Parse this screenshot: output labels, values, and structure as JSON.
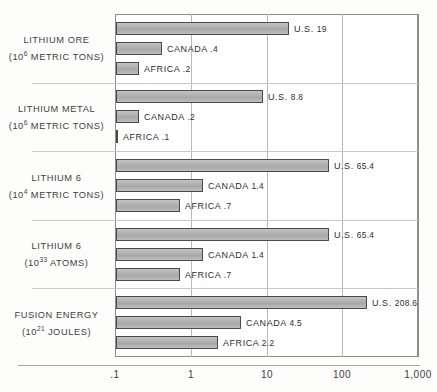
{
  "chart_data": {
    "type": "bar",
    "orientation": "horizontal",
    "title": "",
    "xlabel": "",
    "ylabel": "",
    "xscale": "log",
    "xlim": [
      0.1,
      1000
    ],
    "grid": true,
    "legend_position": "none",
    "xticks": [
      ".1",
      "1",
      "10",
      "100",
      "1,000"
    ],
    "xtick_values": [
      0.1,
      1,
      10,
      100,
      1000
    ],
    "categories": [
      {
        "line1": "LITHIUM ORE",
        "line2_prefix": "(10",
        "line2_exp": "6",
        "line2_suffix": " METRIC TONS)"
      },
      {
        "line1": "LITHIUM METAL",
        "line2_prefix": "(10",
        "line2_exp": "6",
        "line2_suffix": " METRIC TONS)"
      },
      {
        "line1": "LITHIUM 6",
        "line2_prefix": "(10",
        "line2_exp": "4",
        "line2_suffix": " METRIC TONS)"
      },
      {
        "line1": "LITHIUM 6",
        "line2_prefix": "(10",
        "line2_exp": "33",
        "line2_suffix": " ATOMS)"
      },
      {
        "line1": "FUSION ENERGY",
        "line2_prefix": "(10",
        "line2_exp": "21",
        "line2_suffix": " JOULES)"
      }
    ],
    "series": [
      {
        "name": "U.S.",
        "values": [
          19,
          8.8,
          65.4,
          65.4,
          208.6
        ]
      },
      {
        "name": "CANADA",
        "values": [
          0.4,
          0.2,
          1.4,
          1.4,
          4.5
        ]
      },
      {
        "name": "AFRICA",
        "values": [
          0.2,
          0.1,
          0.7,
          0.7,
          2.2
        ]
      }
    ],
    "bars": [
      {
        "group": 0,
        "name": "U.S.",
        "value": 19,
        "value_text": "19",
        "label": "U.S."
      },
      {
        "group": 0,
        "name": "CANADA",
        "value": 0.4,
        "value_text": ".4",
        "label": "CANADA"
      },
      {
        "group": 0,
        "name": "AFRICA",
        "value": 0.2,
        "value_text": ".2",
        "label": "AFRICA"
      },
      {
        "group": 1,
        "name": "U.S.",
        "value": 8.8,
        "value_text": "8.8",
        "label": "U.S."
      },
      {
        "group": 1,
        "name": "CANADA",
        "value": 0.2,
        "value_text": ".2",
        "label": "CANADA"
      },
      {
        "group": 1,
        "name": "AFRICA",
        "value": 0.1,
        "value_text": ".1",
        "label": "AFRICA"
      },
      {
        "group": 2,
        "name": "U.S.",
        "value": 65.4,
        "value_text": "65.4",
        "label": "U.S."
      },
      {
        "group": 2,
        "name": "CANADA",
        "value": 1.4,
        "value_text": "1.4",
        "label": "CANADA"
      },
      {
        "group": 2,
        "name": "AFRICA",
        "value": 0.7,
        "value_text": ".7",
        "label": "AFRICA"
      },
      {
        "group": 3,
        "name": "U.S.",
        "value": 65.4,
        "value_text": "65.4",
        "label": "U.S."
      },
      {
        "group": 3,
        "name": "CANADA",
        "value": 1.4,
        "value_text": "1.4",
        "label": "CANADA"
      },
      {
        "group": 3,
        "name": "AFRICA",
        "value": 0.7,
        "value_text": ".7",
        "label": "AFRICA"
      },
      {
        "group": 4,
        "name": "U.S.",
        "value": 208.6,
        "value_text": "208.6",
        "label": "U.S."
      },
      {
        "group": 4,
        "name": "CANADA",
        "value": 4.5,
        "value_text": "4.5",
        "label": "CANADA"
      },
      {
        "group": 4,
        "name": "AFRICA",
        "value": 2.2,
        "value_text": "2.2",
        "label": "AFRICA"
      }
    ],
    "colors": {
      "bar_fill": "#b4b4b4",
      "bar_border": "#4a4a4a",
      "gridline": "#b9b9b9",
      "frame": "#8d8d8d",
      "text": "#3b3b3b",
      "background": "#ffffff"
    }
  }
}
